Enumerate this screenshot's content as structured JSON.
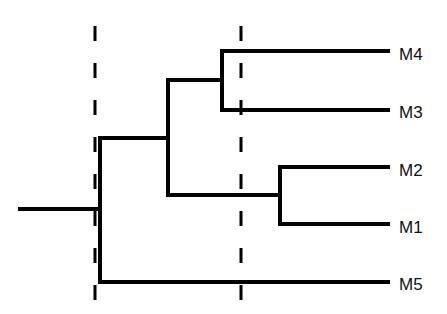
{
  "diagram": {
    "type": "dendrogram",
    "orientation": "left-to-right",
    "line_color": "#000000",
    "background": "#ffffff",
    "leaves": [
      {
        "id": "M4",
        "label": "M4",
        "y": 51
      },
      {
        "id": "M3",
        "label": "M3",
        "y": 110
      },
      {
        "id": "M2",
        "label": "M2",
        "y": 167
      },
      {
        "id": "M1",
        "label": "M1",
        "y": 224
      },
      {
        "id": "M5",
        "label": "M5",
        "y": 282
      }
    ],
    "clusters": [
      {
        "name": "M4-M3",
        "members": [
          "M4",
          "M3"
        ],
        "node_x": 222
      },
      {
        "name": "M2-M1",
        "members": [
          "M2",
          "M1"
        ],
        "node_x": 280
      },
      {
        "name": "M4-M3-M2-M1",
        "members": [
          "M4-M3",
          "M2-M1"
        ],
        "node_x": 168
      },
      {
        "name": "root",
        "members": [
          "M4-M3-M2-M1",
          "M5"
        ],
        "node_x": 100
      }
    ],
    "cut_lines": [
      {
        "name": "cut-line-left",
        "x": 95,
        "style": "dashed"
      },
      {
        "name": "cut-line-right",
        "x": 241,
        "style": "dashed"
      }
    ]
  }
}
